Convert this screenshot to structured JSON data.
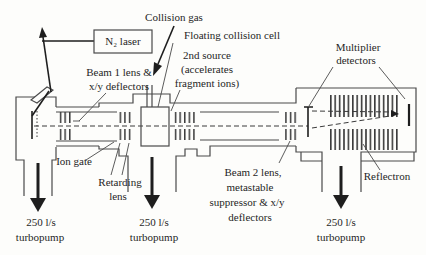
{
  "labels": {
    "collision_gas": "Collision gas",
    "n2_laser": "N₂ laser",
    "floating_cell": "Floating collision cell",
    "second_source_l1": "2nd source",
    "second_source_l2": "(accelerates",
    "second_source_l3": "fragment ions)",
    "multiplier_l1": "Multiplier",
    "multiplier_l2": "detectors",
    "beam1_l1": "Beam 1 lens &",
    "beam1_l2": "x/y deflectors",
    "ion_gate": "Ion gate",
    "retarding_l1": "Retarding",
    "retarding_l2": "lens",
    "beam2_l1": "Beam 2 lens,",
    "beam2_l2": "metastable",
    "beam2_l3": "suppressor & x/y",
    "beam2_l4": "deflectors",
    "reflectron": "Reflectron"
  },
  "pumps": [
    {
      "flow": "250 l/s",
      "name": "turbopump"
    },
    {
      "flow": "250 l/s",
      "name": "turbopump"
    },
    {
      "flow": "250 l/s",
      "name": "turbopump"
    }
  ],
  "colors": {
    "line": "#3a3a3a",
    "text": "#1f1f1f",
    "background": "#fdfdfb"
  }
}
